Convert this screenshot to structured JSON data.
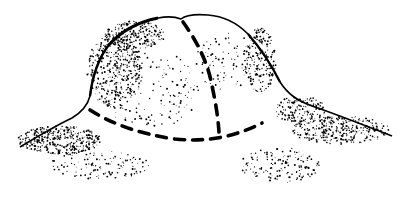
{
  "illustration": {
    "subject": "stippled ink drawing of a dome-shaped mound",
    "background_color": "#ffffff",
    "ink_color": "#000000",
    "section_lines": "dashed"
  }
}
